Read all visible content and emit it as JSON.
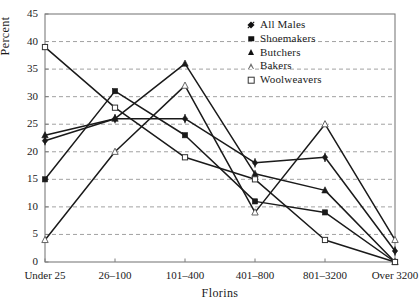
{
  "chart_data": {
    "type": "line",
    "title": "",
    "xlabel": "Florins",
    "ylabel": "Percent",
    "categories": [
      "Under 25",
      "26–100",
      "101–400",
      "401–800",
      "801–3200",
      "Over 3200"
    ],
    "ylim": [
      0,
      45
    ],
    "yticks": [
      0,
      5,
      10,
      15,
      20,
      25,
      30,
      35,
      40,
      45
    ],
    "ytick_labels": [
      "0",
      "5",
      "10",
      "15",
      "20",
      "25",
      "30",
      "35",
      "40",
      "45"
    ],
    "grid": true,
    "grid_style": "dashed-horizontal",
    "legend_position": "top-right",
    "series": [
      {
        "name": "All Males",
        "marker": "filled-diamond",
        "values": [
          22,
          26,
          26,
          18,
          19,
          2
        ]
      },
      {
        "name": "Shoemakers",
        "marker": "filled-square",
        "values": [
          15,
          31,
          23,
          11,
          9,
          0
        ]
      },
      {
        "name": "Butchers",
        "marker": "filled-triangle",
        "values": [
          23,
          26,
          36,
          16,
          13,
          0
        ]
      },
      {
        "name": "Bakers",
        "marker": "open-triangle",
        "values": [
          4,
          20,
          32,
          9,
          25,
          4
        ]
      },
      {
        "name": "Woolweavers",
        "marker": "open-square",
        "values": [
          39,
          28,
          19,
          15,
          4,
          0
        ]
      }
    ]
  },
  "legend": {
    "items": [
      {
        "label": "All Males"
      },
      {
        "label": "Shoemakers"
      },
      {
        "label": "Butchers"
      },
      {
        "label": "Bakers"
      },
      {
        "label": "Woolweavers"
      }
    ]
  },
  "colors": {
    "line": "#1a1a1a",
    "grid": "#8a8a8a",
    "frame": "#7d7d7d",
    "text": "#1a1a1a",
    "background": "#ffffff"
  }
}
